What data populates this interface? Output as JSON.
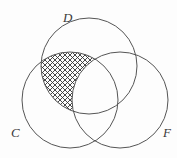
{
  "figure": {
    "name": "three-circle-venn-diagram",
    "background_color": "#fdfdfd",
    "stroke_color": "#555555",
    "hatch_color": "#333333",
    "width": 177,
    "height": 158
  },
  "sets": [
    {
      "id": "D",
      "label": "D",
      "label_x": 63,
      "label_y": 22,
      "center_x": 89,
      "center_y": 66,
      "radius": 48
    },
    {
      "id": "C",
      "label": "C",
      "label_x": 11,
      "label_y": 137,
      "center_x": 70,
      "center_y": 100,
      "radius": 48
    },
    {
      "id": "F",
      "label": "F",
      "label_x": 163,
      "label_y": 137,
      "center_x": 120,
      "center_y": 100,
      "radius": 48
    }
  ],
  "shaded_region": {
    "name": "c-and-d-minus-f",
    "description": "lens of C and D intersection excluding F",
    "fill": "crosshatch",
    "hatch_spacing": 5,
    "hatch_angles": [
      45,
      -45
    ]
  }
}
